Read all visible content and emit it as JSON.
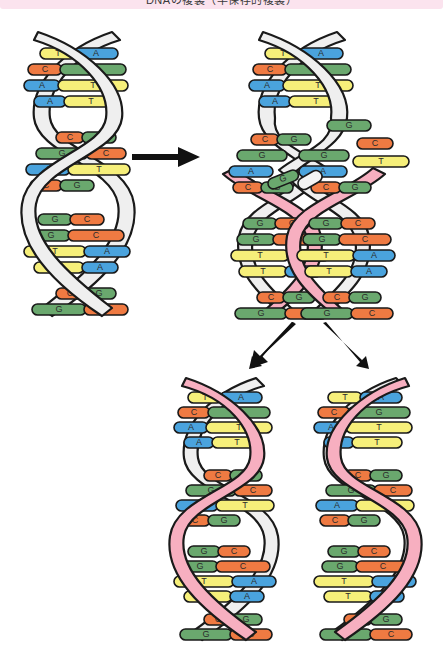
{
  "header": {
    "title": "DNAの複製（半保存的複製）",
    "band_color": "#fbe3ee"
  },
  "legend_colors": {
    "adenine": "#4aa3dd",
    "thymine": "#f6ef7a",
    "guanine": "#6aa86e",
    "cytosine": "#ef7a42",
    "template_strand": "#efefef",
    "new_strand": "#f7afc0",
    "outline": "#1a1a1a",
    "arrow": "#111111",
    "background": "#ffffff"
  },
  "bases": {
    "A": {
      "letter": "A",
      "color": "#4aa3dd",
      "name": "adenine"
    },
    "T": {
      "letter": "T",
      "color": "#f6ef7a",
      "name": "thymine"
    },
    "G": {
      "letter": "G",
      "color": "#6aa86e",
      "name": "guanine"
    },
    "C": {
      "letter": "C",
      "color": "#ef7a42",
      "name": "cytosine"
    }
  },
  "sequence": {
    "left_strand": [
      "T",
      "C",
      "A",
      "A",
      "C",
      "G",
      "A",
      "C",
      "G",
      "G",
      "T",
      "T",
      "C",
      "G"
    ],
    "right_strand": [
      "A",
      "G",
      "T",
      "T",
      "G",
      "C",
      "T",
      "G",
      "C",
      "C",
      "A",
      "A",
      "G",
      "C"
    ],
    "pair_labels": [
      "T-A",
      "C-G",
      "A-T",
      "A-T",
      "C-G",
      "G-C",
      "A-T",
      "C-G",
      "G-C",
      "G-C",
      "T-A",
      "T-A",
      "C-G",
      "G-C"
    ]
  },
  "panels": [
    {
      "id": "parent-helix",
      "label": "親DNA二重らせん",
      "strand_types": [
        "template",
        "template"
      ],
      "stage": 1
    },
    {
      "id": "replication-fork",
      "label": "複製フォーク（鎖の開裂と新生鎖合成）",
      "strand_types": [
        "template",
        "new",
        "template",
        "new"
      ],
      "stage": 2
    },
    {
      "id": "daughter-helix-left",
      "label": "娘DNA分子1",
      "strand_types": [
        "new",
        "template"
      ],
      "stage": 3
    },
    {
      "id": "daughter-helix-right",
      "label": "娘DNA分子2",
      "strand_types": [
        "template",
        "new"
      ],
      "stage": 3
    }
  ],
  "arrows": [
    {
      "id": "arrow-main",
      "direction": "right",
      "from": "parent-helix",
      "to": "replication-fork"
    },
    {
      "id": "arrow-left",
      "direction": "down-left",
      "from": "replication-fork",
      "to": "daughter-helix-left"
    },
    {
      "id": "arrow-right",
      "direction": "down-right",
      "from": "replication-fork",
      "to": "daughter-helix-right"
    }
  ],
  "free_nucleotides": [
    {
      "base": "G",
      "color": "#6aa86e"
    },
    {
      "base": "",
      "color": "#f4f4f4"
    }
  ]
}
